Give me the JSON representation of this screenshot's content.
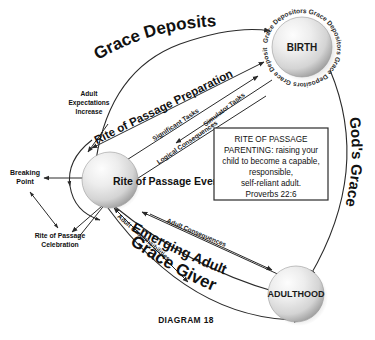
{
  "diagram": {
    "caption": "DIAGRAM 18",
    "nodes": [
      {
        "id": "birth",
        "label": "BIRTH",
        "orbit_text": "Grace Depositors Grace Depositors Grace Depositors Grace Depositors "
      },
      {
        "id": "rite-of-passage-event",
        "label": "Rite of Passage Event",
        "orbit_text": ""
      },
      {
        "id": "adulthood",
        "label": "ADULTHOOD",
        "orbit_text": ""
      }
    ],
    "edge_labels": [
      {
        "id": "grace-deposits",
        "text": "Grace Deposits"
      },
      {
        "id": "rite-of-passage-preparation",
        "text": "Rite of Passage Preparation"
      },
      {
        "id": "significant-tasks",
        "text": "Significant Tasks"
      },
      {
        "id": "simulator-tasks",
        "text": "Simulator Tasks"
      },
      {
        "id": "logical-consequences",
        "text": "Logical Consequences"
      },
      {
        "id": "adult-expectations-increase",
        "text": "Adult Expectations Increase"
      },
      {
        "id": "breaking-point",
        "text": "Breaking Point"
      },
      {
        "id": "rite-of-passage-celebration",
        "text": "Rite of Passage Celebration"
      },
      {
        "id": "adult-responsibilities",
        "text": "Adult Responsibilities"
      },
      {
        "id": "adult-consequences",
        "text": "Adult Consequences"
      },
      {
        "id": "emerging-adult",
        "text": "Emerging Adult"
      },
      {
        "id": "grace-giver",
        "text": "Grace Giver"
      },
      {
        "id": "gods-grace",
        "text": "God's Grace"
      }
    ],
    "labels": {
      "grace_deposits": "Grace Deposits",
      "rite_of_passage_preparation": "Rite of Passage Preparation",
      "significant_tasks": "Significant Tasks",
      "simulator_tasks": "Simulator Tasks",
      "logical_consequences": "Logical Consequences",
      "adult_expectations_l1": "Adult",
      "adult_expectations_l2": "Expectations",
      "adult_expectations_l3": "Increase",
      "breaking_point_l1": "Breaking",
      "breaking_point_l2": "Point",
      "rop_celebration_l1": "Rite of Passage",
      "rop_celebration_l2": "Celebration",
      "adult_responsibilities": "Adult Responsibilities",
      "adult_consequences": "Adult Consequences",
      "emerging_adult": "Emerging Adult",
      "grace_giver": "Grace Giver",
      "gods_grace": "God's Grace",
      "birth": "BIRTH",
      "adulthood": "ADULTHOOD",
      "rite_of_passage_event": "Rite of Passage Event",
      "orbit_birth": "Grace Depositors Grace Depositors Grace Depositors Grace Depositors "
    },
    "textbox": {
      "line1": "RITE OF PASSAGE",
      "line2": "PARENTING: raising your",
      "line3": "child to become a capable,",
      "line4": "responsible,",
      "line5": "self-reliant adult.",
      "line6": "Proverbs 22:6"
    },
    "colors": {
      "background": "#ffffff",
      "stroke": "#2a2a2a",
      "text": "#111111",
      "sphere_light": "#f4f4f4",
      "sphere_mid": "#d2d2d2",
      "sphere_dark": "#9a9a9a",
      "shadow": "#b9b9b9"
    }
  }
}
